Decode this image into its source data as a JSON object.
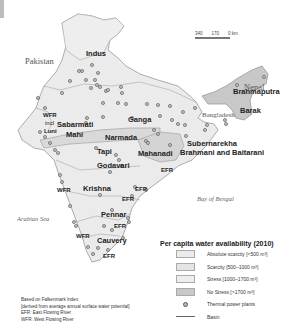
{
  "map": {
    "title": "Per capita water availability (2010)",
    "countries": [
      "Pakistan",
      "Nepal",
      "Bangladesh"
    ],
    "seas": [
      "Arabian Sea",
      "Bay of Bengal"
    ],
    "scale_bar": {
      "labels": [
        "340",
        "170",
        "0 km"
      ]
    },
    "basins": {
      "indus": "Indus",
      "ganga": "Ganga",
      "brahmaputra": "Brahmaputra",
      "barak": "Barak",
      "wfr_luni_1": "WFR",
      "wfr_luni_2": "incl",
      "wfr_luni_3": "Luni",
      "sabarmati": "Sabarmati",
      "mahi": "Mahi",
      "narmada": "Narmada",
      "tapi": "Tapi",
      "mahanadi": "Mahanadi",
      "subernarekha": "Subernarekha",
      "brahmani": "Brahmani and Baitarani",
      "godavari": "Godavari",
      "krishna": "Krishna",
      "pennar": "Pennar",
      "cauvery": "Cauvery",
      "efr_1": "EFR",
      "efr_2": "EFR",
      "efr_3": "EFR",
      "efr_4": "EFR",
      "efr_5": "EFR",
      "wfr_1": "WFR",
      "wfr_2": "WFR",
      "wfr_3": "WFR"
    }
  },
  "legend": {
    "title": "Per capita water availability (2010)",
    "items": [
      {
        "label": "Absolute scarcity [<500 m³]",
        "color": "#ebebeb"
      },
      {
        "label": "Scarcity [500–1000 m³]",
        "color": "#e4e4e4"
      },
      {
        "label": "Stress [1000–1700 m³]",
        "color": "#eeeeee"
      },
      {
        "label": "No Stress [>1700 m³]",
        "color": "#c8c8c8"
      },
      {
        "label": "Thermal power plants",
        "icon": "power-plant-dot-icon"
      },
      {
        "label": "Basin",
        "icon": "basin-line-icon"
      }
    ]
  },
  "notes": [
    "Based on Falkenmark Index",
    "[derived from average annual surface water potential]",
    "EFR: East Flowing River",
    "WFR: West Flowing River"
  ]
}
